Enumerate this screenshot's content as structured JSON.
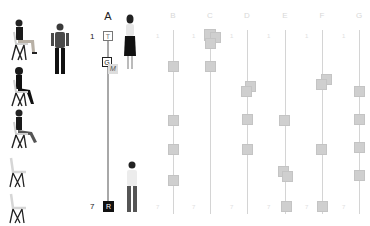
{
  "columns": [
    {
      "label": "A",
      "x": 108,
      "active": true
    },
    {
      "label": "B",
      "x": 173,
      "active": false
    },
    {
      "label": "C",
      "x": 210,
      "active": false
    },
    {
      "label": "D",
      "x": 247,
      "active": false
    },
    {
      "label": "E",
      "x": 285,
      "active": false
    },
    {
      "label": "F",
      "x": 322,
      "active": false
    },
    {
      "label": "G",
      "x": 359,
      "active": false
    }
  ],
  "rows": {
    "start": "1",
    "end": "7"
  },
  "column_a": {
    "markers": [
      {
        "label": "T",
        "style": "outline"
      },
      {
        "label": "G",
        "style": "bold"
      },
      {
        "label": "M",
        "style": "faded"
      },
      {
        "label": "R",
        "style": "dark"
      }
    ]
  },
  "figures": {
    "seated": [
      "person-seated-1",
      "person-seated-2",
      "person-seated-3"
    ],
    "empty_chairs": 2,
    "standing": [
      "person-standing-left",
      "person-standing-woman",
      "person-standing-man"
    ]
  },
  "colors": {
    "active_track": "#a8a8a8",
    "inactive_track": "#d4d4d4",
    "gray_marker": "#cfcfcf",
    "dark_marker": "#111111"
  }
}
